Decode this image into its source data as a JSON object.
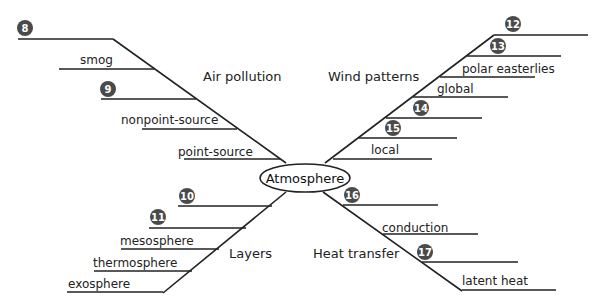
{
  "diagram": {
    "center": "Atmosphere",
    "colors": {
      "line": "#222222",
      "badge": "#4a4a4a",
      "badge_text": "#ffffff"
    },
    "branches": [
      {
        "category": "Air pollution",
        "items": [
          {
            "badge": "8",
            "label": ""
          },
          {
            "badge": "",
            "label": "smog"
          },
          {
            "badge": "9",
            "label": ""
          },
          {
            "badge": "",
            "label": "nonpoint-source"
          },
          {
            "badge": "",
            "label": "point-source"
          }
        ]
      },
      {
        "category": "Wind patterns",
        "items": [
          {
            "badge": "12",
            "label": ""
          },
          {
            "badge": "13",
            "label": ""
          },
          {
            "badge": "",
            "label": "polar easterlies"
          },
          {
            "badge": "",
            "label": "global"
          },
          {
            "badge": "14",
            "label": ""
          },
          {
            "badge": "15",
            "label": ""
          },
          {
            "badge": "",
            "label": "local"
          }
        ]
      },
      {
        "category": "Layers",
        "items": [
          {
            "badge": "10",
            "label": ""
          },
          {
            "badge": "11",
            "label": ""
          },
          {
            "badge": "",
            "label": "mesosphere"
          },
          {
            "badge": "",
            "label": "thermosphere"
          },
          {
            "badge": "",
            "label": "exosphere"
          }
        ]
      },
      {
        "category": "Heat transfer",
        "items": [
          {
            "badge": "16",
            "label": ""
          },
          {
            "badge": "",
            "label": "conduction"
          },
          {
            "badge": "17",
            "label": ""
          },
          {
            "badge": "",
            "label": "latent heat"
          }
        ]
      }
    ]
  }
}
